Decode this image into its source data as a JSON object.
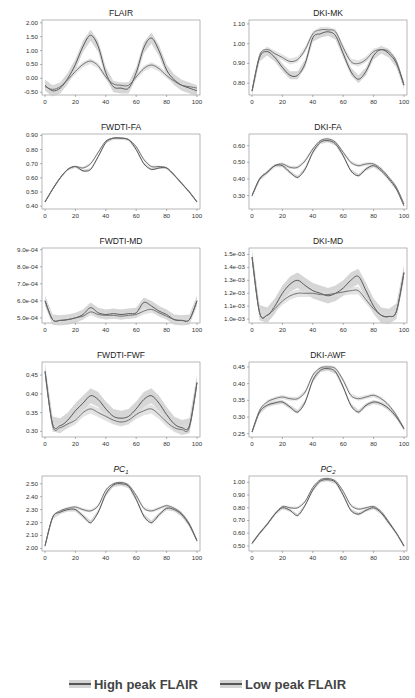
{
  "legend": {
    "items": [
      {
        "label": "High peak FLAIR",
        "color": "#555555",
        "band": "#d4d4d4"
      },
      {
        "label": "Low peak FLAIR",
        "color": "#555555",
        "band": "#d4d4d4"
      }
    ]
  },
  "chart_data": [
    {
      "type": "line",
      "title": "FLAIR",
      "title_italic": false,
      "x": [
        0,
        5,
        10,
        15,
        20,
        25,
        30,
        35,
        40,
        45,
        50,
        55,
        60,
        65,
        70,
        75,
        80,
        85,
        90,
        95,
        100
      ],
      "xticks": [
        0,
        20,
        40,
        60,
        80,
        100
      ],
      "ylim": [
        -0.6,
        2.1
      ],
      "yticks": [
        -0.5,
        0.0,
        0.5,
        1.0,
        1.5,
        2.0
      ],
      "ytick_labels": [
        "-0.50",
        "0.00",
        "0.50",
        "1.00",
        "1.50",
        "2.00"
      ],
      "series": [
        {
          "name": "High peak FLAIR",
          "values": [
            -0.25,
            -0.45,
            -0.35,
            0.0,
            0.5,
            1.15,
            1.55,
            1.15,
            0.2,
            -0.3,
            -0.35,
            -0.35,
            0.2,
            1.1,
            1.45,
            1.0,
            0.3,
            -0.05,
            -0.25,
            -0.35,
            -0.45
          ],
          "band": 0.2
        },
        {
          "name": "Low peak FLAIR",
          "values": [
            -0.3,
            -0.4,
            -0.3,
            -0.05,
            0.25,
            0.5,
            0.62,
            0.45,
            0.05,
            -0.2,
            -0.25,
            -0.25,
            0.05,
            0.35,
            0.48,
            0.35,
            0.1,
            -0.1,
            -0.25,
            -0.3,
            -0.35
          ],
          "band": 0.1
        }
      ]
    },
    {
      "type": "line",
      "title": "DKI-MK",
      "title_italic": false,
      "x": [
        0,
        5,
        10,
        15,
        20,
        25,
        30,
        35,
        40,
        45,
        50,
        55,
        60,
        65,
        70,
        75,
        80,
        85,
        90,
        95,
        100
      ],
      "xticks": [
        0,
        20,
        40,
        60,
        80,
        100
      ],
      "ylim": [
        0.74,
        1.12
      ],
      "yticks": [
        0.8,
        0.9,
        1.0,
        1.1
      ],
      "ytick_labels": [
        "0.80",
        "0.90",
        "1.00",
        "1.10"
      ],
      "series": [
        {
          "name": "High peak FLAIR",
          "values": [
            0.76,
            0.93,
            0.96,
            0.93,
            0.88,
            0.84,
            0.84,
            0.9,
            1.03,
            1.05,
            1.06,
            1.04,
            0.95,
            0.86,
            0.82,
            0.86,
            0.94,
            0.97,
            0.95,
            0.9,
            0.79
          ],
          "band": 0.02
        },
        {
          "name": "Low peak FLAIR",
          "values": [
            0.76,
            0.94,
            0.97,
            0.95,
            0.93,
            0.91,
            0.92,
            0.97,
            1.05,
            1.07,
            1.07,
            1.06,
            0.98,
            0.91,
            0.9,
            0.92,
            0.96,
            0.97,
            0.96,
            0.91,
            0.79
          ],
          "band": 0.015
        }
      ]
    },
    {
      "type": "line",
      "title": "FWDTI-FA",
      "title_italic": false,
      "x": [
        0,
        5,
        10,
        15,
        20,
        25,
        30,
        35,
        40,
        45,
        50,
        55,
        60,
        65,
        70,
        75,
        80,
        85,
        90,
        95,
        100
      ],
      "xticks": [
        0,
        20,
        40,
        60,
        80,
        100
      ],
      "ylim": [
        0.38,
        0.91
      ],
      "yticks": [
        0.4,
        0.5,
        0.6,
        0.7,
        0.8,
        0.9
      ],
      "ytick_labels": [
        "0.40",
        "0.50",
        "0.60",
        "0.70",
        "0.80",
        "0.90"
      ],
      "series": [
        {
          "name": "High peak FLAIR",
          "values": [
            0.43,
            0.52,
            0.6,
            0.66,
            0.68,
            0.65,
            0.66,
            0.75,
            0.85,
            0.88,
            0.88,
            0.87,
            0.8,
            0.7,
            0.66,
            0.67,
            0.67,
            0.62,
            0.56,
            0.5,
            0.43
          ],
          "band": 0.008
        },
        {
          "name": "Low peak FLAIR",
          "values": [
            0.43,
            0.52,
            0.6,
            0.66,
            0.68,
            0.67,
            0.7,
            0.78,
            0.86,
            0.88,
            0.88,
            0.87,
            0.82,
            0.73,
            0.68,
            0.68,
            0.67,
            0.62,
            0.56,
            0.5,
            0.43
          ],
          "band": 0.008
        }
      ]
    },
    {
      "type": "line",
      "title": "DKI-FA",
      "title_italic": false,
      "x": [
        0,
        5,
        10,
        15,
        20,
        25,
        30,
        35,
        40,
        45,
        50,
        55,
        60,
        65,
        70,
        75,
        80,
        85,
        90,
        95,
        100
      ],
      "xticks": [
        0,
        20,
        40,
        60,
        80,
        100
      ],
      "ylim": [
        0.22,
        0.67
      ],
      "yticks": [
        0.3,
        0.4,
        0.5,
        0.6
      ],
      "ytick_labels": [
        "0.30",
        "0.40",
        "0.50",
        "0.60"
      ],
      "series": [
        {
          "name": "High peak FLAIR",
          "values": [
            0.3,
            0.4,
            0.44,
            0.48,
            0.48,
            0.44,
            0.41,
            0.46,
            0.56,
            0.62,
            0.63,
            0.61,
            0.54,
            0.45,
            0.42,
            0.46,
            0.48,
            0.45,
            0.4,
            0.34,
            0.24
          ],
          "band": 0.01
        },
        {
          "name": "Low peak FLAIR",
          "values": [
            0.3,
            0.4,
            0.44,
            0.48,
            0.49,
            0.47,
            0.47,
            0.51,
            0.58,
            0.63,
            0.64,
            0.62,
            0.56,
            0.5,
            0.48,
            0.49,
            0.49,
            0.46,
            0.41,
            0.35,
            0.25
          ],
          "band": 0.01
        }
      ]
    },
    {
      "type": "line",
      "title": "FWDTI-MD",
      "title_italic": false,
      "x": [
        0,
        5,
        10,
        15,
        20,
        25,
        30,
        35,
        40,
        45,
        50,
        55,
        60,
        65,
        70,
        75,
        80,
        85,
        90,
        95,
        100
      ],
      "xticks": [
        0,
        20,
        40,
        60,
        80,
        100
      ],
      "ylim": [
        0.00047,
        0.00091
      ],
      "yticks": [
        0.0005,
        0.0006,
        0.0007,
        0.0008,
        0.0009
      ],
      "ytick_labels": [
        "5.0e-04",
        "6.0e-04",
        "7.0e-04",
        "8.0e-04",
        "9.0e-04"
      ],
      "series": [
        {
          "name": "High peak FLAIR",
          "values": [
            0.0006,
            0.00049,
            0.000485,
            0.00049,
            0.0005,
            0.00052,
            0.00056,
            0.00053,
            0.00052,
            0.000525,
            0.00052,
            0.000525,
            0.00053,
            0.00059,
            0.00057,
            0.00054,
            0.00052,
            0.00049,
            0.000485,
            0.00049,
            0.0006
          ],
          "band": 3e-05
        },
        {
          "name": "Low peak FLAIR",
          "values": [
            0.0006,
            0.00049,
            0.000485,
            0.00049,
            0.0005,
            0.00051,
            0.000535,
            0.00052,
            0.000515,
            0.000515,
            0.00051,
            0.000515,
            0.00052,
            0.00054,
            0.00055,
            0.00053,
            0.00051,
            0.00049,
            0.000485,
            0.00049,
            0.0006
          ],
          "band": 2e-05
        }
      ]
    },
    {
      "type": "line",
      "title": "DKI-MD",
      "title_italic": false,
      "x": [
        0,
        5,
        10,
        15,
        20,
        25,
        30,
        35,
        40,
        45,
        50,
        55,
        60,
        65,
        70,
        75,
        80,
        85,
        90,
        95,
        100
      ],
      "xticks": [
        0,
        20,
        40,
        60,
        80,
        100
      ],
      "ylim": [
        0.00097,
        0.00155
      ],
      "yticks": [
        0.001,
        0.0011,
        0.0012,
        0.0013,
        0.0014,
        0.0015
      ],
      "ytick_labels": [
        "1.0e-03",
        "1.1e-03",
        "1.2e-03",
        "1.3e-03",
        "1.4e-03",
        "1.5e-03"
      ],
      "series": [
        {
          "name": "High peak FLAIR",
          "values": [
            0.00148,
            0.00105,
            0.00103,
            0.0011,
            0.0012,
            0.00127,
            0.0013,
            0.00126,
            0.00122,
            0.0012,
            0.00118,
            0.0012,
            0.00124,
            0.0013,
            0.00133,
            0.00122,
            0.0011,
            0.00103,
            0.00102,
            0.00106,
            0.00136
          ],
          "band": 6e-05
        },
        {
          "name": "Low peak FLAIR",
          "values": [
            0.00148,
            0.00105,
            0.00103,
            0.00108,
            0.00114,
            0.00118,
            0.0012,
            0.0012,
            0.0012,
            0.00119,
            0.00119,
            0.0012,
            0.00121,
            0.00122,
            0.00122,
            0.00115,
            0.00108,
            0.00103,
            0.00102,
            0.00106,
            0.00136
          ],
          "band": 3e-05
        }
      ]
    },
    {
      "type": "line",
      "title": "FWDTI-FWF",
      "title_italic": false,
      "x": [
        0,
        5,
        10,
        15,
        20,
        25,
        30,
        35,
        40,
        45,
        50,
        55,
        60,
        65,
        70,
        75,
        80,
        85,
        90,
        95,
        100
      ],
      "xticks": [
        0,
        20,
        40,
        60,
        80,
        100
      ],
      "ylim": [
        0.285,
        0.485
      ],
      "yticks": [
        0.3,
        0.35,
        0.4,
        0.45
      ],
      "ytick_labels": [
        "0.30",
        "0.35",
        "0.40",
        "0.45"
      ],
      "series": [
        {
          "name": "High peak FLAIR",
          "values": [
            0.46,
            0.32,
            0.315,
            0.33,
            0.355,
            0.375,
            0.395,
            0.385,
            0.36,
            0.34,
            0.335,
            0.34,
            0.36,
            0.385,
            0.395,
            0.375,
            0.345,
            0.32,
            0.31,
            0.315,
            0.43
          ],
          "band": 0.02
        },
        {
          "name": "Low peak FLAIR",
          "values": [
            0.46,
            0.315,
            0.31,
            0.32,
            0.33,
            0.35,
            0.36,
            0.35,
            0.34,
            0.33,
            0.325,
            0.33,
            0.345,
            0.355,
            0.36,
            0.345,
            0.325,
            0.31,
            0.305,
            0.31,
            0.43
          ],
          "band": 0.012
        }
      ]
    },
    {
      "type": "line",
      "title": "DKI-AWF",
      "title_italic": false,
      "x": [
        0,
        5,
        10,
        15,
        20,
        25,
        30,
        35,
        40,
        45,
        50,
        55,
        60,
        65,
        70,
        75,
        80,
        85,
        90,
        95,
        100
      ],
      "xticks": [
        0,
        20,
        40,
        60,
        80,
        100
      ],
      "ylim": [
        0.24,
        0.465
      ],
      "yticks": [
        0.25,
        0.3,
        0.35,
        0.4,
        0.45
      ],
      "ytick_labels": [
        "0.25",
        "0.30",
        "0.35",
        "0.40",
        "0.45"
      ],
      "series": [
        {
          "name": "High peak FLAIR",
          "values": [
            0.255,
            0.315,
            0.335,
            0.342,
            0.345,
            0.33,
            0.315,
            0.345,
            0.41,
            0.44,
            0.445,
            0.435,
            0.39,
            0.335,
            0.315,
            0.335,
            0.345,
            0.34,
            0.325,
            0.3,
            0.265
          ],
          "band": 0.006
        },
        {
          "name": "Low peak FLAIR",
          "values": [
            0.255,
            0.32,
            0.345,
            0.355,
            0.36,
            0.355,
            0.355,
            0.375,
            0.425,
            0.447,
            0.45,
            0.445,
            0.41,
            0.365,
            0.355,
            0.36,
            0.365,
            0.355,
            0.335,
            0.305,
            0.265
          ],
          "band": 0.006
        }
      ]
    },
    {
      "type": "line",
      "title": "PC",
      "title_sub": "1",
      "title_italic": true,
      "x": [
        0,
        5,
        10,
        15,
        20,
        25,
        30,
        35,
        40,
        45,
        50,
        55,
        60,
        65,
        70,
        75,
        80,
        85,
        90,
        95,
        100
      ],
      "xticks": [
        0,
        20,
        40,
        60,
        80,
        100
      ],
      "ylim": [
        1.98,
        2.56
      ],
      "yticks": [
        2.0,
        2.1,
        2.2,
        2.3,
        2.4,
        2.5
      ],
      "ytick_labels": [
        "2.00",
        "2.10",
        "2.20",
        "2.30",
        "2.40",
        "2.50"
      ],
      "series": [
        {
          "name": "High peak FLAIR",
          "values": [
            2.02,
            2.24,
            2.28,
            2.3,
            2.3,
            2.25,
            2.2,
            2.28,
            2.42,
            2.49,
            2.5,
            2.48,
            2.38,
            2.25,
            2.2,
            2.26,
            2.31,
            2.3,
            2.26,
            2.18,
            2.06
          ],
          "band": 0.015
        },
        {
          "name": "Low peak FLAIR",
          "values": [
            2.02,
            2.24,
            2.29,
            2.31,
            2.32,
            2.3,
            2.29,
            2.33,
            2.45,
            2.5,
            2.51,
            2.49,
            2.41,
            2.31,
            2.29,
            2.31,
            2.33,
            2.31,
            2.27,
            2.19,
            2.06
          ],
          "band": 0.012
        }
      ]
    },
    {
      "type": "line",
      "title": "PC",
      "title_sub": "2",
      "title_italic": true,
      "x": [
        0,
        5,
        10,
        15,
        20,
        25,
        30,
        35,
        40,
        45,
        50,
        55,
        60,
        65,
        70,
        75,
        80,
        85,
        90,
        95,
        100
      ],
      "xticks": [
        0,
        20,
        40,
        60,
        80,
        100
      ],
      "ylim": [
        0.46,
        1.05
      ],
      "yticks": [
        0.5,
        0.6,
        0.7,
        0.8,
        0.9,
        1.0
      ],
      "ytick_labels": [
        "0.50",
        "0.60",
        "0.70",
        "0.80",
        "0.90",
        "1.00"
      ],
      "series": [
        {
          "name": "High peak FLAIR",
          "values": [
            0.52,
            0.6,
            0.67,
            0.75,
            0.8,
            0.78,
            0.74,
            0.82,
            0.94,
            1.01,
            1.02,
            1.0,
            0.9,
            0.78,
            0.75,
            0.78,
            0.8,
            0.76,
            0.68,
            0.6,
            0.5
          ],
          "band": 0.012
        },
        {
          "name": "Low peak FLAIR",
          "values": [
            0.52,
            0.6,
            0.67,
            0.75,
            0.81,
            0.8,
            0.8,
            0.85,
            0.96,
            1.02,
            1.03,
            1.01,
            0.93,
            0.82,
            0.79,
            0.8,
            0.81,
            0.77,
            0.69,
            0.6,
            0.5
          ],
          "band": 0.01
        }
      ]
    }
  ]
}
